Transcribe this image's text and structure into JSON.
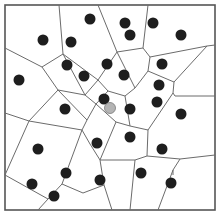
{
  "diagram": {
    "type": "voronoi",
    "frame": {
      "x": 5,
      "y": 5,
      "width": 210,
      "height": 205
    },
    "colors": {
      "site": "#1e1e1e",
      "highlight_site": "#b4b4b4",
      "highlight_stroke": "#7a7a7a",
      "edge": "#6b6b6b",
      "frame": "#555555"
    },
    "site_radius": 5.5,
    "sites": [
      {
        "x": 90,
        "y": 19
      },
      {
        "x": 125,
        "y": 23
      },
      {
        "x": 153,
        "y": 23
      },
      {
        "x": 43,
        "y": 40
      },
      {
        "x": 71,
        "y": 42
      },
      {
        "x": 130,
        "y": 35
      },
      {
        "x": 181,
        "y": 35
      },
      {
        "x": 67,
        "y": 65
      },
      {
        "x": 107,
        "y": 64
      },
      {
        "x": 162,
        "y": 64
      },
      {
        "x": 84,
        "y": 76
      },
      {
        "x": 124,
        "y": 75
      },
      {
        "x": 19,
        "y": 80
      },
      {
        "x": 159,
        "y": 85
      },
      {
        "x": 104,
        "y": 99
      },
      {
        "x": 130,
        "y": 109
      },
      {
        "x": 157,
        "y": 102
      },
      {
        "x": 65,
        "y": 109
      },
      {
        "x": 181,
        "y": 114
      },
      {
        "x": 38,
        "y": 149
      },
      {
        "x": 97,
        "y": 143
      },
      {
        "x": 130,
        "y": 137
      },
      {
        "x": 162,
        "y": 149
      },
      {
        "x": 66,
        "y": 173
      },
      {
        "x": 32,
        "y": 184
      },
      {
        "x": 54,
        "y": 196
      },
      {
        "x": 100,
        "y": 180
      },
      {
        "x": 141,
        "y": 173
      },
      {
        "x": 171,
        "y": 183
      }
    ],
    "highlight_site": {
      "x": 110,
      "y": 108
    },
    "edges": [
      [
        59,
        5,
        63,
        54
      ],
      [
        63,
        54,
        98,
        80
      ],
      [
        63,
        54,
        42,
        67
      ],
      [
        42,
        67,
        5,
        48
      ],
      [
        98,
        80,
        85,
        95
      ],
      [
        85,
        95,
        63,
        54
      ],
      [
        85,
        95,
        58,
        90
      ],
      [
        58,
        90,
        42,
        67
      ],
      [
        58,
        90,
        29,
        121
      ],
      [
        29,
        121,
        5,
        113
      ],
      [
        29,
        121,
        5,
        175
      ],
      [
        98,
        80,
        117,
        52
      ],
      [
        117,
        52,
        143,
        48
      ],
      [
        143,
        48,
        150,
        57
      ],
      [
        150,
        57,
        148,
        71
      ],
      [
        148,
        71,
        135,
        88
      ],
      [
        135,
        88,
        117,
        52
      ],
      [
        117,
        52,
        98,
        5
      ],
      [
        143,
        48,
        148,
        5
      ],
      [
        150,
        57,
        207,
        46
      ],
      [
        207,
        46,
        215,
        45
      ],
      [
        148,
        71,
        174,
        82
      ],
      [
        174,
        82,
        173,
        93
      ],
      [
        173,
        93,
        175,
        96
      ],
      [
        175,
        96,
        215,
        96
      ],
      [
        174,
        82,
        207,
        46
      ],
      [
        135,
        88,
        125,
        96
      ],
      [
        125,
        96,
        108,
        91
      ],
      [
        108,
        91,
        98,
        80
      ],
      [
        108,
        91,
        96,
        104
      ],
      [
        96,
        104,
        85,
        95
      ],
      [
        96,
        104,
        116,
        122
      ],
      [
        125,
        96,
        130,
        126
      ],
      [
        130,
        126,
        116,
        122
      ],
      [
        96,
        104,
        87,
        120
      ],
      [
        87,
        120,
        58,
        90
      ],
      [
        87,
        120,
        82,
        130
      ],
      [
        82,
        130,
        29,
        121
      ],
      [
        82,
        130,
        90,
        144
      ],
      [
        90,
        144,
        100,
        160
      ],
      [
        100,
        160,
        116,
        122
      ],
      [
        130,
        126,
        148,
        130
      ],
      [
        148,
        130,
        173,
        93
      ],
      [
        148,
        130,
        147,
        156
      ],
      [
        147,
        156,
        135,
        160
      ],
      [
        135,
        160,
        100,
        160
      ],
      [
        147,
        156,
        180,
        159
      ],
      [
        180,
        159,
        215,
        155
      ],
      [
        100,
        160,
        104,
        185
      ],
      [
        104,
        185,
        112,
        210
      ],
      [
        104,
        185,
        83,
        193
      ],
      [
        83,
        193,
        62,
        184
      ],
      [
        62,
        184,
        82,
        130
      ],
      [
        62,
        184,
        48,
        199
      ],
      [
        48,
        199,
        38,
        210
      ],
      [
        48,
        199,
        5,
        175
      ],
      [
        135,
        160,
        130,
        210
      ],
      [
        180,
        159,
        173,
        170
      ],
      [
        173,
        170,
        158,
        210
      ],
      [
        173,
        175,
        173,
        170
      ]
    ]
  }
}
